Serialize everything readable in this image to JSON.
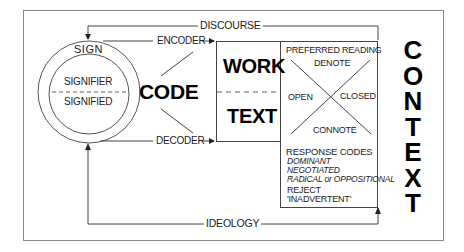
{
  "diagram": {
    "top_loop_label": "DISCOURSE",
    "bottom_loop_label": "IDEOLOGY",
    "sign": {
      "title": "SIGN",
      "upper": "SIGNIFIER",
      "lower": "SIGNIFIED"
    },
    "code_label": "CODE",
    "encoder_label": "ENCODER",
    "decoder_label": "DECODER",
    "work_text": {
      "upper": "WORK",
      "lower": "TEXT"
    },
    "reading": {
      "title": "PREFERRED READING",
      "top": "DENOTE",
      "left": "OPEN",
      "right": "CLOSED",
      "bottom": "CONNOTE"
    },
    "response": {
      "title": "RESPONSE CODES",
      "items": [
        "DOMINANT",
        "NEGOTIATED",
        "RADICAL or OPPOSITIONAL"
      ],
      "reject_title": "REJECT",
      "reject_item": "'INADVERTENT'"
    },
    "context_letters": [
      "C",
      "O",
      "N",
      "T",
      "E",
      "X",
      "T"
    ],
    "colors": {
      "line": "#555555",
      "frame": "#888888",
      "text": "#000000"
    }
  }
}
